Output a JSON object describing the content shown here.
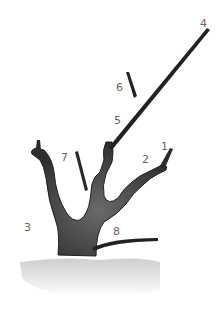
{
  "diagram": {
    "colors": {
      "wood": "#2a2a2a",
      "trunk_shade": "#555555",
      "ground": "#d9d9d9",
      "label": "#666666"
    },
    "labels": [
      {
        "id": "1",
        "text": "1",
        "x": 161,
        "y": 141
      },
      {
        "id": "2",
        "text": "2",
        "x": 142,
        "y": 154
      },
      {
        "id": "3",
        "text": "3",
        "x": 24,
        "y": 222
      },
      {
        "id": "4",
        "text": "4",
        "x": 200,
        "y": 18
      },
      {
        "id": "5",
        "text": "5",
        "x": 114,
        "y": 115
      },
      {
        "id": "6",
        "text": "6",
        "x": 116,
        "y": 82
      },
      {
        "id": "7",
        "text": "7",
        "x": 61,
        "y": 152
      },
      {
        "id": "8",
        "text": "8",
        "x": 113,
        "y": 226
      }
    ]
  }
}
